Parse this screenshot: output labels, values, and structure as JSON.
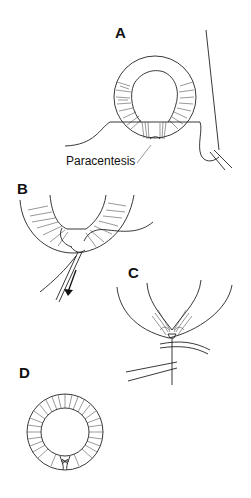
{
  "figure": {
    "panels": [
      {
        "id": "A",
        "label": "A",
        "caption": "Paracentesis"
      },
      {
        "id": "B",
        "label": "B"
      },
      {
        "id": "C",
        "label": "C"
      },
      {
        "id": "D",
        "label": "D"
      }
    ]
  }
}
